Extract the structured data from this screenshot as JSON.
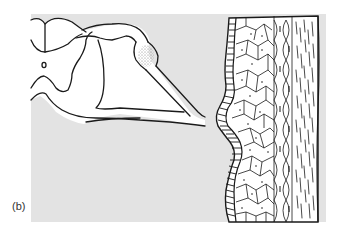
{
  "figure": {
    "label": "(b)",
    "background_color": "#e3e3e3",
    "line_color": "#1a1a1a",
    "ganglion_stipple_color": "#8a8a8a",
    "left_drawing": "spinal-cord-with-dorsal-root-ganglion",
    "right_drawing": "epithelial-tissue-layers"
  }
}
